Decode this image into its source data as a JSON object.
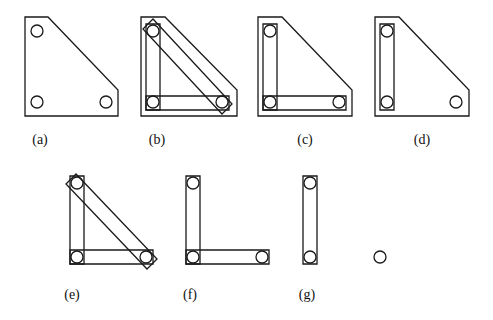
{
  "figure": {
    "background": "#ffffff",
    "line_color": "#1a1a1a",
    "circle_radius": 6,
    "panels": [
      {
        "id": "a",
        "label": "(a)",
        "label_pos": [
          40,
          142
        ],
        "plate": [
          [
            25,
            17
          ],
          [
            48,
            17
          ],
          [
            118,
            90
          ],
          [
            118,
            116
          ],
          [
            25,
            116
          ]
        ],
        "circles": [
          [
            37,
            31
          ],
          [
            37,
            102
          ],
          [
            106,
            102
          ]
        ],
        "bands": []
      },
      {
        "id": "b",
        "label": "(b)",
        "label_pos": [
          157,
          142
        ],
        "plate": [
          [
            141,
            17
          ],
          [
            165,
            17
          ],
          [
            237,
            90
          ],
          [
            237,
            116
          ],
          [
            141,
            116
          ]
        ],
        "circles": [
          [
            153,
            31
          ],
          [
            153,
            102
          ],
          [
            222,
            102
          ]
        ],
        "bands": [
          [
            [
              146,
              24
            ],
            [
              160,
              24
            ],
            [
              160,
              110
            ],
            [
              146,
              110
            ]
          ],
          [
            [
              146,
              96
            ],
            [
              229,
              96
            ],
            [
              229,
              110
            ],
            [
              146,
              110
            ]
          ],
          [
            [
              143,
              29
            ],
            [
              153,
              19
            ],
            [
              232,
              104
            ],
            [
              222,
              114
            ]
          ]
        ]
      },
      {
        "id": "c",
        "label": "(c)",
        "label_pos": [
          305,
          142
        ],
        "plate": [
          [
            258,
            17
          ],
          [
            282,
            17
          ],
          [
            352,
            90
          ],
          [
            352,
            116
          ],
          [
            258,
            116
          ]
        ],
        "circles": [
          [
            270,
            31
          ],
          [
            270,
            102
          ],
          [
            339,
            102
          ]
        ],
        "bands": [
          [
            [
              263,
              24
            ],
            [
              277,
              24
            ],
            [
              277,
              110
            ],
            [
              263,
              110
            ]
          ],
          [
            [
              263,
              96
            ],
            [
              346,
              96
            ],
            [
              346,
              110
            ],
            [
              263,
              110
            ]
          ]
        ]
      },
      {
        "id": "d",
        "label": "(d)",
        "label_pos": [
          422,
          142
        ],
        "plate": [
          [
            375,
            17
          ],
          [
            399,
            17
          ],
          [
            469,
            90
          ],
          [
            469,
            116
          ],
          [
            375,
            116
          ]
        ],
        "circles": [
          [
            387,
            31
          ],
          [
            387,
            102
          ],
          [
            456,
            102
          ]
        ],
        "bands": [
          [
            [
              380,
              24
            ],
            [
              394,
              24
            ],
            [
              394,
              110
            ],
            [
              380,
              110
            ]
          ]
        ]
      },
      {
        "id": "e",
        "label": "(e)",
        "label_pos": [
          72,
          297
        ],
        "plate": [],
        "circles": [
          [
            77,
            183
          ],
          [
            77,
            257
          ],
          [
            146,
            257
          ]
        ],
        "bands": [
          [
            [
              70,
              176
            ],
            [
              84,
              176
            ],
            [
              84,
              264
            ],
            [
              70,
              264
            ]
          ],
          [
            [
              70,
              250
            ],
            [
              153,
              250
            ],
            [
              153,
              264
            ],
            [
              70,
              264
            ]
          ],
          [
            [
              66,
              184
            ],
            [
              76,
              174
            ],
            [
              157,
              259
            ],
            [
              147,
              269
            ]
          ]
        ]
      },
      {
        "id": "f",
        "label": "(f)",
        "label_pos": [
          190,
          297
        ],
        "plate": [],
        "circles": [
          [
            193,
            183
          ],
          [
            193,
            257
          ],
          [
            262,
            257
          ]
        ],
        "bands": [
          [
            [
              186,
              176
            ],
            [
              200,
              176
            ],
            [
              200,
              264
            ],
            [
              186,
              264
            ]
          ],
          [
            [
              186,
              250
            ],
            [
              269,
              250
            ],
            [
              269,
              264
            ],
            [
              186,
              264
            ]
          ]
        ]
      },
      {
        "id": "g",
        "label": "(g)",
        "label_pos": [
          307,
          297
        ],
        "plate": [],
        "circles": [
          [
            310,
            183
          ],
          [
            310,
            257
          ]
        ],
        "bands": [
          [
            [
              303,
              176
            ],
            [
              317,
              176
            ],
            [
              317,
              264
            ],
            [
              303,
              264
            ]
          ]
        ]
      },
      {
        "id": "g2",
        "label": "",
        "label_pos": [
          380,
          297
        ],
        "plate": [],
        "circles": [
          [
            380,
            257
          ]
        ],
        "bands": []
      }
    ]
  }
}
